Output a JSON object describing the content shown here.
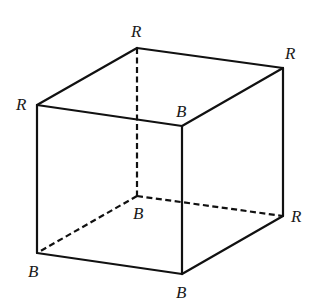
{
  "diagram": {
    "type": "cube-vertex-coloring",
    "colors": {
      "line": "#111111",
      "label": "#1a1a1a",
      "background": "#ffffff"
    },
    "vertices": [
      {
        "id": "top_back_left",
        "label": "R",
        "x": 137,
        "y": 48,
        "label_x": 131,
        "label_y": 37
      },
      {
        "id": "top_back_right",
        "label": "R",
        "x": 283,
        "y": 68,
        "label_x": 285,
        "label_y": 59
      },
      {
        "id": "top_front_left",
        "label": "R",
        "x": 37,
        "y": 105,
        "label_x": 16,
        "label_y": 110
      },
      {
        "id": "top_front_right",
        "label": "B",
        "x": 182,
        "y": 126,
        "label_x": 176,
        "label_y": 117
      },
      {
        "id": "bottom_back_left",
        "label": "B",
        "x": 137,
        "y": 196,
        "label_x": 133,
        "label_y": 219
      },
      {
        "id": "bottom_back_right",
        "label": "R",
        "x": 283,
        "y": 216,
        "label_x": 291,
        "label_y": 222
      },
      {
        "id": "bottom_front_left",
        "label": "B",
        "x": 37,
        "y": 253,
        "label_x": 28,
        "label_y": 277
      },
      {
        "id": "bottom_front_right",
        "label": "B",
        "x": 182,
        "y": 274,
        "label_x": 176,
        "label_y": 298
      }
    ],
    "edges_visible": [
      [
        "top_front_left",
        "top_back_left"
      ],
      [
        "top_back_left",
        "top_back_right"
      ],
      [
        "top_back_right",
        "top_front_right"
      ],
      [
        "top_front_right",
        "top_front_left"
      ],
      [
        "top_front_left",
        "bottom_front_left"
      ],
      [
        "top_front_right",
        "bottom_front_right"
      ],
      [
        "top_back_right",
        "bottom_back_right"
      ],
      [
        "bottom_front_left",
        "bottom_front_right"
      ],
      [
        "bottom_front_right",
        "bottom_back_right"
      ]
    ],
    "edges_hidden": [
      [
        "top_back_left",
        "bottom_back_left"
      ],
      [
        "bottom_back_left",
        "bottom_front_left"
      ],
      [
        "bottom_back_left",
        "bottom_back_right"
      ]
    ]
  }
}
